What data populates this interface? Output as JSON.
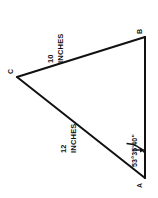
{
  "diagram": {
    "type": "triangle-geometry",
    "orientation_note": "rotated 90 degrees",
    "background_color": "#ffffff",
    "stroke_color": "#111111",
    "vertices": [
      {
        "id": "A",
        "label": "A",
        "x": 145,
        "y": 178
      },
      {
        "id": "B",
        "label": "B",
        "x": 145,
        "y": 37
      },
      {
        "id": "C",
        "label": "C",
        "x": 17,
        "y": 77
      }
    ],
    "sides": [
      {
        "id": "CB",
        "from": "C",
        "to": "B",
        "value": "10",
        "unit": "INCHES"
      },
      {
        "id": "CA",
        "from": "C",
        "to": "A",
        "value": "12",
        "unit": "INCHES"
      },
      {
        "id": "AB",
        "from": "A",
        "to": "B",
        "value": "",
        "unit": ""
      }
    ],
    "angles": [
      {
        "at": "A",
        "text": "53°35'40\""
      }
    ]
  },
  "labels": {
    "vertex_a": "A",
    "vertex_b": "B",
    "vertex_c": "C",
    "side_cb_num": "10",
    "side_cb_unit": "INCHES",
    "side_ca_num": "12",
    "side_ca_unit": "INCHES",
    "angle_a": "53°35'40\""
  }
}
